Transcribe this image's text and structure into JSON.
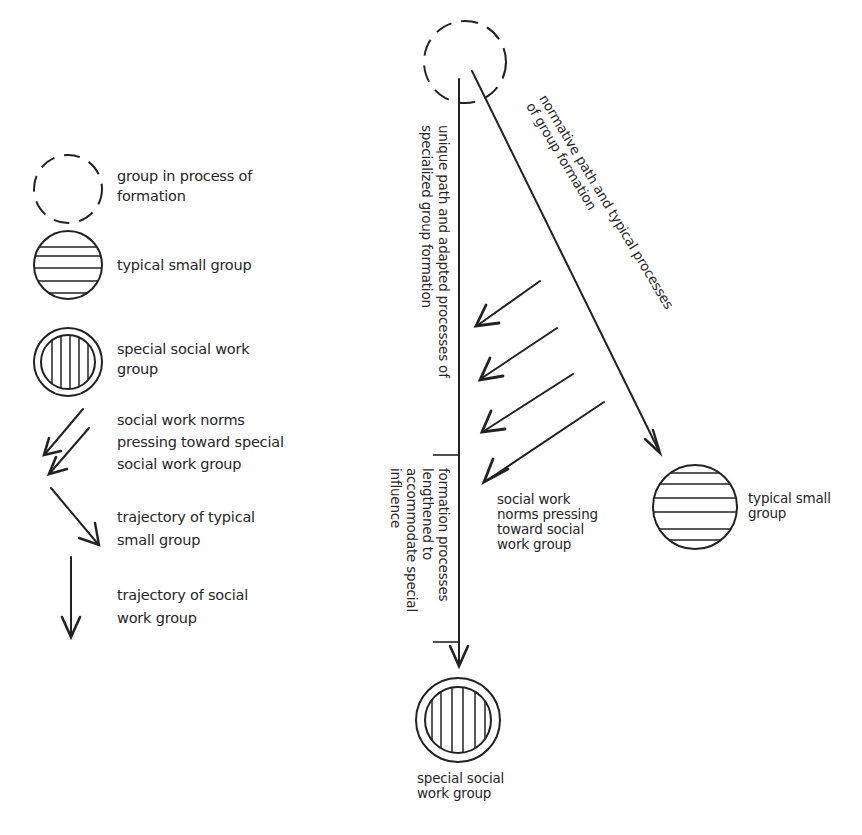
{
  "legend": {
    "items": [
      {
        "symbol": "dashed-circle",
        "label_lines": [
          "group in process of",
          "formation"
        ]
      },
      {
        "symbol": "horizontal-striped-circle",
        "label_lines": [
          "typical small group"
        ]
      },
      {
        "symbol": "double-ring-vertical-striped-circle",
        "label_lines": [
          "special social work",
          "group"
        ]
      },
      {
        "symbol": "double-diagonal-arrows",
        "label_lines": [
          "social work norms",
          "pressing toward special",
          "social work group"
        ]
      },
      {
        "symbol": "diagonal-arrow",
        "label_lines": [
          "trajectory of typical",
          "small group"
        ]
      },
      {
        "symbol": "vertical-arrow",
        "label_lines": [
          "trajectory of social",
          "work group"
        ]
      }
    ]
  },
  "diagram": {
    "unique_path_label": [
      "unique path and adapted processes of",
      "specialized group formation"
    ],
    "normative_path_label": [
      "normative path and typical processes",
      "of group formation"
    ],
    "formation_bracket_label": [
      "formation processes",
      "lengthened to",
      "accommodate special",
      "influence"
    ],
    "norms_label": [
      "social work",
      "norms pressing",
      "toward social",
      "work group"
    ],
    "typical_group_label": [
      "typical small",
      "group"
    ],
    "special_group_label": [
      "special social",
      "work group"
    ],
    "pressing_arrow_count": 4
  },
  "colors": {
    "ink": "#222222",
    "background": "#ffffff"
  }
}
